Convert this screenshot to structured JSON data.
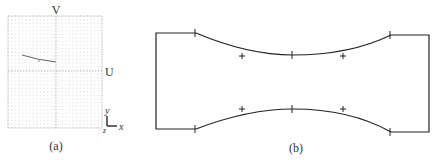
{
  "panel_a": {
    "caption": "(a)",
    "axis_labels": {
      "v": "V",
      "u": "U"
    },
    "triad": {
      "y": "y",
      "x": "x",
      "z": "z"
    },
    "grid": {
      "x0": 8,
      "y0": 16,
      "x1": 102,
      "y1": 128,
      "step": 3.6
    },
    "colors": {
      "grid": "#c8c8c8",
      "axis": "#aaaaaa",
      "curve": "#666666"
    }
  },
  "panel_b": {
    "caption": "(b)",
    "colors": {
      "outline": "#222222"
    }
  }
}
